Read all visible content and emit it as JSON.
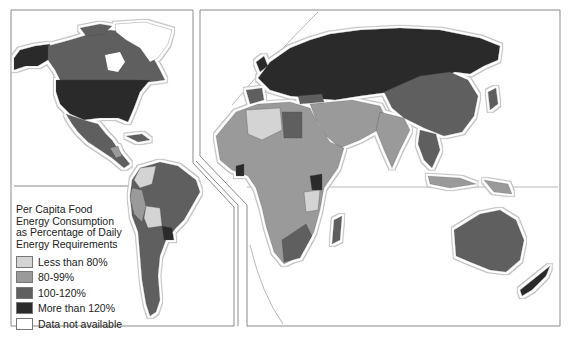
{
  "map": {
    "title": "Per Capita Food Energy Consumption as Percentage of Daily Energy Requirements",
    "panels": [
      "Americas",
      "Eurasia-Africa-Oceania"
    ],
    "colors": {
      "lt80": "#d4d4d4",
      "p80_99": "#9a9a9a",
      "p100_120": "#5f5f5f",
      "gt120": "#2b2b2b",
      "na": "#ffffff",
      "halo": "#c8c8c8",
      "frame": "#888888"
    }
  },
  "legend": {
    "title_lines": [
      "Per Capita Food",
      "Energy Consumption",
      "as Percentage of Daily",
      "Energy Requirements"
    ],
    "items": [
      {
        "label": "Less than 80%",
        "color": "#d4d4d4"
      },
      {
        "label": "80-99%",
        "color": "#9a9a9a"
      },
      {
        "label": "100-120%",
        "color": "#5f5f5f"
      },
      {
        "label": "More than 120%",
        "color": "#2b2b2b"
      },
      {
        "label": "Data not available",
        "color": "#ffffff"
      }
    ]
  },
  "regions": {
    "north_america_us": "More than 120%",
    "canada": "100-120%",
    "alaska": "More than 120%",
    "greenland": "Data not available",
    "mexico": "100-120%",
    "brazil": "100-120%",
    "argentina": "100-120%",
    "bolivia": "Less than 80%",
    "paraguay": "More than 120%",
    "peru": "80-99%",
    "colombia": "Less than 80%",
    "europe": "More than 120%",
    "ussr": "More than 120%",
    "china": "100-120%",
    "india": "80-99%",
    "middle_east": "80-99%",
    "north_africa_algeria": "Less than 80%",
    "libya": "100-120%",
    "sub_saharan_africa": "80-99%",
    "tanzania": "Less than 80%",
    "south_africa": "100-120%",
    "madagascar": "100-120%",
    "australia": "100-120%",
    "new_zealand": "More than 120%",
    "indonesia": "80-99%"
  }
}
